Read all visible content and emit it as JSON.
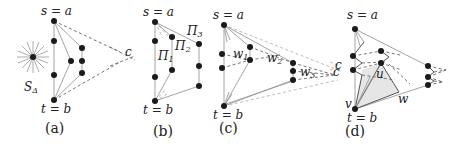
{
  "figure": {
    "panels": [
      {
        "id": "a",
        "caption": "(a)",
        "labels": {
          "top": "s = a",
          "bottom": "t = b",
          "apex": "c",
          "star": "S",
          "star_sub": "Δ"
        }
      },
      {
        "id": "b",
        "caption": "(b)",
        "labels": {
          "top": "s = a",
          "bottom": "t = b",
          "pi1": "Π",
          "pi1_sub": "1",
          "pi2": "Π",
          "pi2_sub": "2",
          "pi3": "Π",
          "pi3_sub": "3"
        }
      },
      {
        "id": "c",
        "caption": "(c)",
        "labels": {
          "top": "s = a",
          "bottom": "t = b",
          "apex": "c",
          "w1": "w",
          "w1_sub": "1",
          "w2": "w",
          "w2_sub": "2",
          "w3": "w",
          "w3_sub": "3"
        }
      },
      {
        "id": "d",
        "caption": "(d)",
        "labels": {
          "top": "s = a",
          "bottom": "t = b",
          "apex": "c",
          "u": "u",
          "v": "v",
          "w": "w"
        }
      }
    ]
  }
}
